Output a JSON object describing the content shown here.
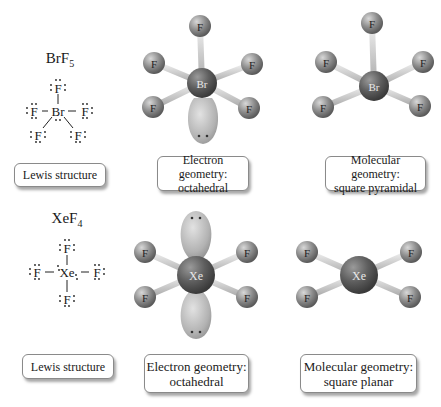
{
  "colors": {
    "background": "#ffffff",
    "fluorine_atom": "#8a8a8a",
    "central_atom": "#5a5a5a",
    "bond": "#bdbdbd",
    "lone_pair_lobe": "#b5b5b5",
    "box_border": "#8a8a8a"
  },
  "rows": [
    {
      "molecule": {
        "base": "BrF",
        "subscript": "5"
      },
      "central_atom": "Br",
      "ligand_atom": "F",
      "lewis_label": "Lewis structure",
      "electron_geometry": {
        "line1": "Electron geometry:",
        "line2": "octahedral"
      },
      "molecular_geometry": {
        "line1": "Molecular geometry:",
        "line2": "square pyramidal"
      }
    },
    {
      "molecule": {
        "base": "XeF",
        "subscript": "4"
      },
      "central_atom": "Xe",
      "ligand_atom": "F",
      "lewis_label": "Lewis structure",
      "electron_geometry": {
        "line1": "Electron geometry:",
        "line2": "octahedral"
      },
      "molecular_geometry": {
        "line1": "Molecular geometry:",
        "line2": "square planar"
      }
    }
  ],
  "lone_pair_symbol": "••"
}
